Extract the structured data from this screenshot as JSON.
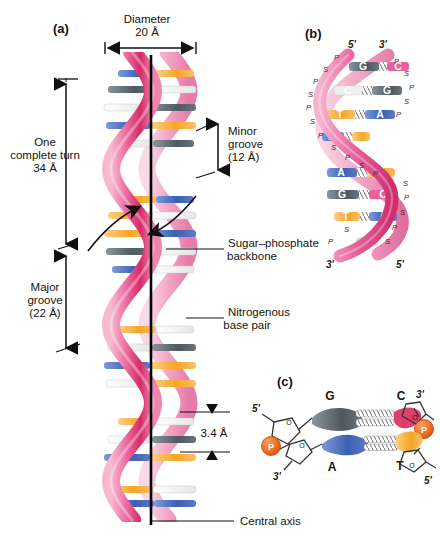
{
  "figure": {
    "background": "#ffffff",
    "panels": [
      {
        "tag": "(a)",
        "name": "panel-a-helix"
      },
      {
        "tag": "(b)",
        "name": "panel-b-helix"
      },
      {
        "tag": "(c)",
        "name": "panel-c-basepair"
      }
    ]
  },
  "panel_a": {
    "tag": "(a)",
    "diameter_label_line1": "Diameter",
    "diameter_label_line2": "20 Å",
    "turn_label_line1": "One",
    "turn_label_line2": "complete turn",
    "turn_label_line3": "34 Å",
    "major_groove_line1": "Major",
    "major_groove_line2": "groove",
    "major_groove_line3": "(22 Å)",
    "minor_groove_line1": "Minor",
    "minor_groove_line2": "groove",
    "minor_groove_line3": "(12 Å)",
    "backbone_line1": "Sugar–phosphate",
    "backbone_line2": "backbone",
    "basepair_line1": "Nitrogenous",
    "basepair_line2": "base pair",
    "rise_label": "3.4 Å",
    "axis_label": "Central axis"
  },
  "panel_b": {
    "tag": "(b)",
    "top_left_prime": "5'",
    "top_right_prime": "3'",
    "bottom_left_prime": "3'",
    "bottom_right_prime": "5'",
    "backbone_letters": [
      "P",
      "S"
    ],
    "base_pairs": [
      {
        "left": "G",
        "right": "C",
        "bonds": 3
      },
      {
        "left": "C",
        "right": "G",
        "bonds": 3
      },
      {
        "left": "T",
        "right": "A",
        "bonds": 2
      },
      {
        "left": "A",
        "right": "T",
        "bonds": 2
      },
      {
        "left": "A",
        "right": "T",
        "bonds": 2
      },
      {
        "left": "G",
        "right": "C",
        "bonds": 3
      },
      {
        "left": "T",
        "right": "A",
        "bonds": 2
      },
      {
        "left": "G",
        "right": "C",
        "bonds": 3
      }
    ]
  },
  "panel_c": {
    "tag": "(c)",
    "top_left_prime": "5'",
    "bottom_left_prime": "3'",
    "top_right_prime": "3'",
    "bottom_right_prime": "5'",
    "phosphate_label": "P",
    "pair_top": {
      "left_base": "G",
      "right_base": "C",
      "bonds": 3
    },
    "pair_bottom": {
      "left_base": "A",
      "right_base": "T",
      "bonds": 2
    }
  },
  "colors": {
    "adenine": "#4a6fc0",
    "thymine": "#f5a623",
    "guanine": "#5c6670",
    "cytosine": "#e03f6e",
    "backbone_pink": "#e8619b",
    "backbone_pink_light": "#f2a8c6",
    "backbone_pink_dark": "#c8235f",
    "phosphate_orange": "#e8681c",
    "axis_black": "#000000",
    "text": "#17130f"
  }
}
